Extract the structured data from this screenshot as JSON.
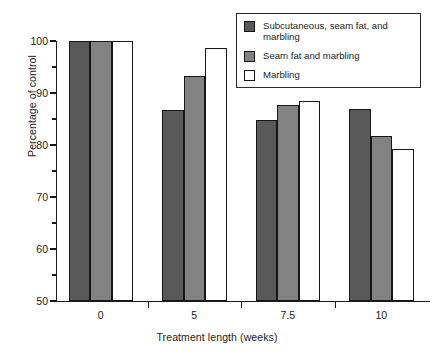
{
  "chart_data": {
    "type": "bar",
    "title": "",
    "subtitle": "",
    "xlabel": "Treatment length (weeks)",
    "ylabel": "Percentage of control",
    "categories": [
      "0",
      "5",
      "7.5",
      "10"
    ],
    "series": [
      {
        "name": "Subcutaneous, seam fat, and marbling",
        "color": "#595959",
        "values": [
          100,
          86.7,
          84.8,
          87.0
        ]
      },
      {
        "name": "Seam fat and marbling",
        "color": "#828282",
        "values": [
          100,
          93.2,
          87.6,
          81.7
        ]
      },
      {
        "name": "Marbling",
        "color": "#ffffff",
        "values": [
          100,
          98.6,
          88.5,
          79.2
        ]
      }
    ],
    "ylim": [
      50,
      100
    ],
    "ytick_major": [
      50,
      60,
      70,
      80,
      90,
      100
    ],
    "ytick_minor": [
      55,
      65,
      75,
      85,
      95
    ],
    "ytick_labels": [
      "50",
      "60",
      "70",
      "80",
      "90",
      "100"
    ],
    "grid": false,
    "legend_position": "top-right",
    "bar_outline_color": "#161616",
    "axis_color": "#1a1a1a",
    "background": "#ffffff"
  },
  "legend": {
    "entries": [
      {
        "label": "Subcutaneous, seam fat, and marbling",
        "swatch": "dark-gray-swatch"
      },
      {
        "label": "Seam fat and marbling",
        "swatch": "medium-gray-swatch"
      },
      {
        "label": "Marbling",
        "swatch": "white-swatch"
      }
    ]
  }
}
